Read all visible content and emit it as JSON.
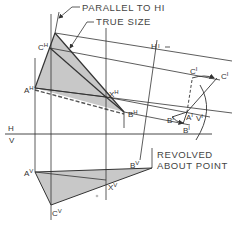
{
  "figure": {
    "annotations": {
      "parallel": "PARALLEL TO H1",
      "parallel_text": "PARALLEL TO HI",
      "true_size": "TRUE SIZE",
      "revolved_line1": "REVOLVED",
      "revolved_line2": "ABOUT POINT"
    },
    "fold_lines": {
      "hv_top": "H",
      "hv_bottom": "V",
      "h1_label": "H",
      "h1_sub": "I"
    },
    "points": {
      "c_h": {
        "base": "C",
        "sup": "H"
      },
      "a_h": {
        "base": "A",
        "sup": "H"
      },
      "x_h": {
        "base": "X",
        "sup": "H"
      },
      "b_h": {
        "base": "B",
        "sup": "H"
      },
      "a_v": {
        "base": "A",
        "sup": "V"
      },
      "b_v": {
        "base": "B",
        "sup": "V"
      },
      "c_v": {
        "base": "C",
        "sup": "V"
      },
      "x_v": {
        "base": "X",
        "sup": "V"
      },
      "c_1": {
        "base": "C",
        "sup": "I"
      },
      "c_1_rev": {
        "base": "C",
        "sup": "I"
      },
      "b_1": {
        "base": "B",
        "sup": "I"
      },
      "b_1_rev": {
        "base": "B",
        "sup": "I"
      },
      "a_1": {
        "base": "A",
        "sup": "I"
      },
      "v_1": {
        "base": "V",
        "sup": "I"
      }
    },
    "colors": {
      "line": "#333333",
      "fill": "#c8c8c8",
      "text": "#333333"
    }
  }
}
